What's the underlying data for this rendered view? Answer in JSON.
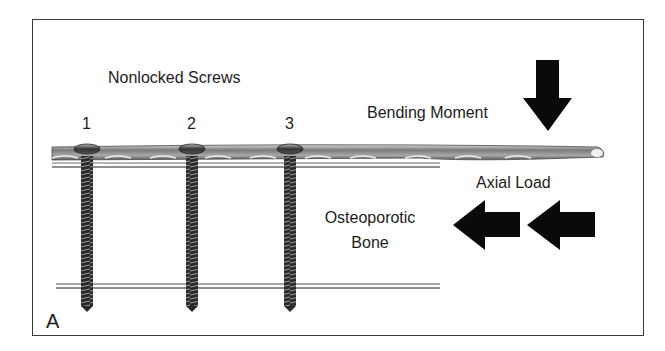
{
  "figure": {
    "panel_label": "A",
    "title_label": "Nonlocked Screws",
    "screws": [
      {
        "number": "1"
      },
      {
        "number": "2"
      },
      {
        "number": "3"
      }
    ],
    "bending_label": "Bending Moment",
    "axial_label": "Axial Load",
    "bone_label_line1": "Osteoporotic",
    "bone_label_line2": "Bone",
    "colors": {
      "arrow": "#0a0a0a",
      "plate": "#8a8a8a",
      "frame": "#3a3a3a",
      "bone_line": "#9a9a9a"
    }
  }
}
